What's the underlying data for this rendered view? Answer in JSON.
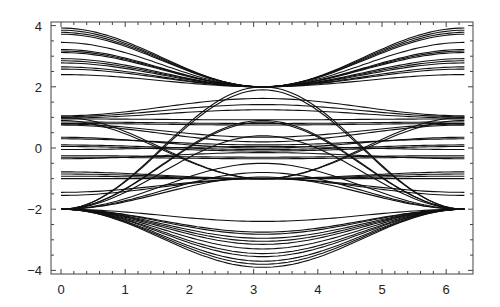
{
  "chart_data": {
    "type": "line",
    "title": "",
    "xlabel": "",
    "ylabel": "",
    "xlim": [
      -0.15,
      6.45
    ],
    "ylim": [
      -4.1,
      4.15
    ],
    "grid": false,
    "legend": null,
    "x_ticks": [
      0,
      1,
      2,
      3,
      4,
      5,
      6
    ],
    "x_tick_labels": [
      "0",
      "1",
      "2",
      "3",
      "4",
      "5",
      "6"
    ],
    "y_ticks": [
      -4,
      -2,
      0,
      2,
      4
    ],
    "y_tick_labels": [
      "−4",
      "−2",
      "0",
      "2",
      "4"
    ],
    "x_domain": [
      0,
      6.283
    ],
    "line_color": "#111111",
    "curve_model": "y(k) = y_pi + (y0 - y_pi) * (1 + cos k) / 2, k in [0, 2pi]",
    "series": [
      {
        "name": "upper-family",
        "curves": [
          {
            "y0": 3.92,
            "y_pi": 2.0
          },
          {
            "y0": 3.85,
            "y_pi": 2.0
          },
          {
            "y0": 3.78,
            "y_pi": 2.0
          },
          {
            "y0": 3.72,
            "y_pi": 2.0
          },
          {
            "y0": 3.45,
            "y_pi": 2.0
          },
          {
            "y0": 3.22,
            "y_pi": 2.0
          },
          {
            "y0": 3.17,
            "y_pi": 2.0
          },
          {
            "y0": 3.12,
            "y_pi": 2.0
          },
          {
            "y0": 2.92,
            "y_pi": 2.0
          },
          {
            "y0": 2.85,
            "y_pi": 2.0
          },
          {
            "y0": 2.78,
            "y_pi": 2.0
          },
          {
            "y0": 2.65,
            "y_pi": 2.0
          },
          {
            "y0": 2.58,
            "y_pi": 2.0
          },
          {
            "y0": 2.4,
            "y_pi": 2.0
          }
        ]
      },
      {
        "name": "upper-middle-family",
        "curves": [
          {
            "y0": 1.05,
            "y_pi": 1.62
          },
          {
            "y0": 1.02,
            "y_pi": 1.42
          },
          {
            "y0": 0.98,
            "y_pi": 1.25
          },
          {
            "y0": 0.95,
            "y_pi": 0.92
          },
          {
            "y0": 0.85,
            "y_pi": 0.8
          },
          {
            "y0": 0.8,
            "y_pi": 0.75
          },
          {
            "y0": 0.78,
            "y_pi": 0.35
          },
          {
            "y0": 0.75,
            "y_pi": 0.2
          },
          {
            "y0": 1.0,
            "y_pi": -1.0
          },
          {
            "y0": 0.9,
            "y_pi": -1.0
          }
        ]
      },
      {
        "name": "central-family",
        "curves": [
          {
            "y0": 0.35,
            "y_pi": 0.0
          },
          {
            "y0": 0.3,
            "y_pi": 0.1
          },
          {
            "y0": 0.1,
            "y_pi": -0.05
          },
          {
            "y0": 0.05,
            "y_pi": -0.1
          },
          {
            "y0": -0.05,
            "y_pi": 0.05
          },
          {
            "y0": -0.25,
            "y_pi": -0.3
          },
          {
            "y0": -0.3,
            "y_pi": -0.35
          },
          {
            "y0": -0.35,
            "y_pi": -0.15
          }
        ]
      },
      {
        "name": "lower-middle-family",
        "curves": [
          {
            "y0": -0.78,
            "y_pi": -1.0
          },
          {
            "y0": -0.85,
            "y_pi": -1.0
          },
          {
            "y0": -0.92,
            "y_pi": -1.0
          },
          {
            "y0": -1.0,
            "y_pi": -1.0
          },
          {
            "y0": -1.45,
            "y_pi": -1.0
          },
          {
            "y0": -1.55,
            "y_pi": -1.0
          },
          {
            "y0": -2.0,
            "y_pi": 2.0
          },
          {
            "y0": -2.0,
            "y_pi": 1.9
          },
          {
            "y0": -2.0,
            "y_pi": 0.9
          },
          {
            "y0": -2.0,
            "y_pi": 0.85
          },
          {
            "y0": -2.0,
            "y_pi": 0.4
          },
          {
            "y0": -2.0,
            "y_pi": -0.5
          },
          {
            "y0": -2.0,
            "y_pi": -0.8
          },
          {
            "y0": -2.0,
            "y_pi": -0.95
          }
        ]
      },
      {
        "name": "lower-family",
        "curves": [
          {
            "y0": -2.0,
            "y_pi": -2.4
          },
          {
            "y0": -2.0,
            "y_pi": -2.75
          },
          {
            "y0": -2.0,
            "y_pi": -2.82
          },
          {
            "y0": -2.0,
            "y_pi": -2.95
          },
          {
            "y0": -2.0,
            "y_pi": -3.05
          },
          {
            "y0": -2.0,
            "y_pi": -3.15
          },
          {
            "y0": -2.0,
            "y_pi": -3.3
          },
          {
            "y0": -2.0,
            "y_pi": -3.45
          },
          {
            "y0": -2.0,
            "y_pi": -3.55
          },
          {
            "y0": -2.0,
            "y_pi": -3.7
          },
          {
            "y0": -2.0,
            "y_pi": -3.8
          },
          {
            "y0": -2.0,
            "y_pi": -3.9
          }
        ]
      }
    ]
  },
  "layout": {
    "frame": {
      "left": 51,
      "top": 22,
      "right": 473,
      "bottom": 274
    },
    "x0_px": 61,
    "x_unit_px": 64.2,
    "y0_px": 148,
    "y_unit_px": 30.6
  }
}
